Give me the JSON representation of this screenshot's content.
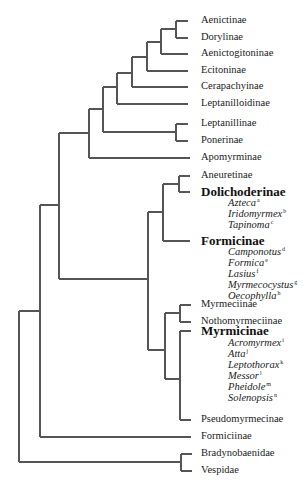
{
  "diagram": {
    "type": "phylogenetic-tree",
    "line_color": "#555555",
    "leaves": [
      {
        "id": "aenictinae",
        "label": "Aenictinae",
        "y": 21,
        "style": "leaf"
      },
      {
        "id": "dorylinae",
        "label": "Dorylinae",
        "y": 38,
        "style": "leaf"
      },
      {
        "id": "aenictogitoninae",
        "label": "Aenictogitoninae",
        "y": 54,
        "style": "leaf"
      },
      {
        "id": "ecitoninae",
        "label": "Ecitoninae",
        "y": 71,
        "style": "leaf"
      },
      {
        "id": "cerapachyinae",
        "label": "Cerapachyinae",
        "y": 87,
        "style": "leaf"
      },
      {
        "id": "leptanilloidinae",
        "label": "Leptanilloidinae",
        "y": 104,
        "style": "leaf"
      },
      {
        "id": "leptanillinae",
        "label": "Leptanillinae",
        "y": 124,
        "style": "leaf"
      },
      {
        "id": "ponerinae",
        "label": "Ponerinae",
        "y": 141,
        "style": "leaf"
      },
      {
        "id": "apomyrminae",
        "label": "Apomyrminae",
        "y": 158,
        "style": "leaf"
      },
      {
        "id": "aneuretinae",
        "label": "Aneuretinae",
        "y": 176,
        "style": "leaf"
      },
      {
        "id": "dolichoderinae",
        "label": "Dolichoderinae",
        "y": 192,
        "style": "major"
      },
      {
        "id": "formicinae",
        "label": "Formicinae",
        "y": 241,
        "style": "major"
      },
      {
        "id": "myrmeciinae",
        "label": "Myrmeciinae",
        "y": 305,
        "style": "leaf"
      },
      {
        "id": "nothomyrmeciinae",
        "label": "Nothomyrmeciinae",
        "y": 322,
        "style": "leaf"
      },
      {
        "id": "myrmicinae",
        "label": "Myrmicinae",
        "y": 331,
        "style": "major"
      },
      {
        "id": "pseudomyrmecinae",
        "label": "Pseudomyrmecinae",
        "y": 420,
        "style": "leaf"
      },
      {
        "id": "formiciinae",
        "label": "Formiciinae",
        "y": 437,
        "style": "leaf"
      },
      {
        "id": "bradynobaenidae",
        "label": "Bradynobaenidae",
        "y": 454,
        "style": "leaf"
      },
      {
        "id": "vespidae",
        "label": "Vespidae",
        "y": 471,
        "style": "leaf"
      }
    ],
    "genera": [
      {
        "name": "Azteca",
        "sup": "a",
        "y": 203
      },
      {
        "name": "Iridomyrmex",
        "sup": "b",
        "y": 214
      },
      {
        "name": "Tapinoma",
        "sup": "c",
        "y": 225
      },
      {
        "name": "Camponotus",
        "sup": "d",
        "y": 252
      },
      {
        "name": "Formica",
        "sup": "e",
        "y": 263
      },
      {
        "name": "Lasius",
        "sup": "f",
        "y": 274
      },
      {
        "name": "Myrmecocystus",
        "sup": "g",
        "y": 285
      },
      {
        "name": "Oecophylla",
        "sup": "h",
        "y": 296
      },
      {
        "name": "Acromyrmex",
        "sup": "i",
        "y": 343
      },
      {
        "name": "Atta",
        "sup": "j",
        "y": 354
      },
      {
        "name": "Leptothorax",
        "sup": "k",
        "y": 365
      },
      {
        "name": "Messor",
        "sup": "l",
        "y": 376
      },
      {
        "name": "Pheidole",
        "sup": "m",
        "y": 387
      },
      {
        "name": "Solenopsis",
        "sup": "n",
        "y": 398
      }
    ],
    "segments": [
      [
        176,
        21,
        188,
        21
      ],
      [
        176,
        38,
        188,
        38
      ],
      [
        176,
        21,
        176,
        38
      ],
      [
        161,
        29,
        176,
        29
      ],
      [
        161,
        29,
        161,
        54
      ],
      [
        161,
        54,
        188,
        54
      ],
      [
        147,
        42,
        161,
        42
      ],
      [
        147,
        42,
        147,
        71
      ],
      [
        147,
        71,
        188,
        71
      ],
      [
        132,
        57,
        147,
        57
      ],
      [
        132,
        57,
        132,
        87
      ],
      [
        132,
        87,
        188,
        87
      ],
      [
        117,
        73,
        132,
        73
      ],
      [
        117,
        73,
        117,
        104
      ],
      [
        117,
        104,
        188,
        104
      ],
      [
        103,
        87,
        117,
        87
      ],
      [
        103,
        87,
        103,
        132
      ],
      [
        103,
        132,
        176,
        132
      ],
      [
        176,
        124,
        176,
        141
      ],
      [
        176,
        124,
        188,
        124
      ],
      [
        176,
        141,
        188,
        141
      ],
      [
        89,
        109,
        103,
        109
      ],
      [
        89,
        109,
        89,
        158
      ],
      [
        89,
        158,
        190,
        158
      ],
      [
        59,
        133,
        89,
        133
      ],
      [
        59,
        133,
        59,
        279
      ],
      [
        179,
        176,
        179,
        192
      ],
      [
        179,
        176,
        190,
        176
      ],
      [
        179,
        192,
        190,
        192
      ],
      [
        163,
        184,
        179,
        184
      ],
      [
        163,
        184,
        163,
        241
      ],
      [
        163,
        241,
        190,
        241
      ],
      [
        148,
        212,
        163,
        212
      ],
      [
        148,
        212,
        148,
        350
      ],
      [
        59,
        279,
        148,
        279
      ],
      [
        148,
        350,
        165,
        350
      ],
      [
        165,
        313,
        165,
        379
      ],
      [
        165,
        313,
        180,
        313
      ],
      [
        180,
        305,
        180,
        322
      ],
      [
        180,
        305,
        191,
        305
      ],
      [
        180,
        322,
        191,
        322
      ],
      [
        165,
        379,
        180,
        379
      ],
      [
        180,
        331,
        180,
        420
      ],
      [
        180,
        331,
        191,
        331
      ],
      [
        180,
        420,
        191,
        420
      ],
      [
        40,
        205,
        59,
        205
      ],
      [
        40,
        205,
        40,
        437
      ],
      [
        40,
        437,
        191,
        437
      ],
      [
        19,
        311,
        40,
        311
      ],
      [
        19,
        311,
        19,
        462
      ],
      [
        19,
        462,
        181,
        462
      ],
      [
        181,
        454,
        181,
        471
      ],
      [
        181,
        454,
        192,
        454
      ],
      [
        181,
        471,
        192,
        471
      ]
    ]
  }
}
